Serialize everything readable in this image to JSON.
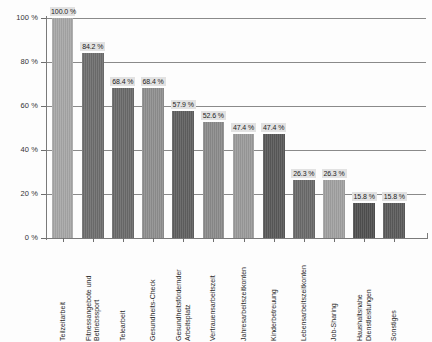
{
  "chart_data": {
    "type": "bar",
    "title": "",
    "subtitle": "",
    "xlabel": "",
    "ylabel": "",
    "ylim": [
      0,
      100
    ],
    "grid": true,
    "legend": "none",
    "orientation": "vertical",
    "categories": [
      "Teilzeitarbeit",
      "Fitnessangebote und Betriebssport",
      "Telearbeit",
      "Gesundheits-Check",
      "Gesundheitsfördernder Arbeitsplatz",
      "Vertrauensarbeitszeit",
      "Jahresarbeitszeitkonten",
      "Kinderbetreuung",
      "Lebensarbeitszeitkonten",
      "Job-Sharing",
      "Haushaltsnahe Dienstleistungen",
      "Sonstiges"
    ],
    "values": [
      100.0,
      84.2,
      68.4,
      68.4,
      57.9,
      52.6,
      47.4,
      47.4,
      26.3,
      26.3,
      15.8,
      15.8
    ],
    "value_labels": [
      "100.0 %",
      "84.2 %",
      "68.4 %",
      "68.4 %",
      "57.9 %",
      "52.6 %",
      "47.4 %",
      "47.4 %",
      "26.3 %",
      "26.3 %",
      "15.8 %",
      "15.8 %"
    ],
    "bar_colors": [
      "#a6a6a6",
      "#6d6d6d",
      "#6a6a6a",
      "#8e8e8e",
      "#5f5f5f",
      "#8a8a8a",
      "#9a9a9a",
      "#585858",
      "#6a6a6a",
      "#a0a0a0",
      "#4f4f4f",
      "#5a5a5a"
    ],
    "y_ticks": [
      0,
      20,
      40,
      60,
      80,
      100
    ],
    "y_tick_labels": [
      "0 %",
      "20 %",
      "40 %",
      "60 %",
      "80 %",
      "100 %"
    ],
    "category_label_lines": [
      [
        "Teilzeitarbeit"
      ],
      [
        "Fitnessangebote und",
        "Betriebssport"
      ],
      [
        "Telearbeit"
      ],
      [
        "Gesundheits-Check"
      ],
      [
        "Gesundheitsfördernder",
        "Arbeitsplatz"
      ],
      [
        "Vertrauensarbeitszeit"
      ],
      [
        "Jahresarbeitszeitkonten"
      ],
      [
        "Kinderbetreuung"
      ],
      [
        "Lebensarbeitszeitkonten"
      ],
      [
        "Job-Sharing"
      ],
      [
        "Haushaltsnahe",
        "Dienstleistungen"
      ],
      [
        "Sonstiges"
      ]
    ]
  },
  "colors": {
    "axis": "#7a7a7a",
    "gridline": "#8a8a8a",
    "label_box": "#e2e2e2",
    "text": "#2a2a2a",
    "background": "#fdfdfd"
  }
}
